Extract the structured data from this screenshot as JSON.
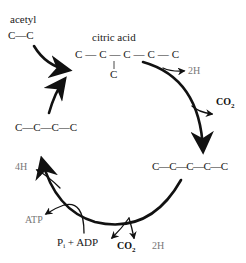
{
  "diagram": {
    "colors": {
      "main": "#111111",
      "secondary_label": "#777777"
    },
    "inputs": {
      "acetyl_label": "acetyl",
      "acetyl_formula": "C—C"
    },
    "compounds": {
      "citric_acid_label": "citric acid",
      "citric_acid_chain": "C—C—C—C—C",
      "citric_acid_branch": "C",
      "five_carbon": "C—C—C—C—C",
      "four_carbon": "C—C—C—C"
    },
    "outputs": {
      "h2_top": "2H",
      "co2_right_main": "CO",
      "co2_right_sub": "2",
      "four_h": "4H",
      "atp": "ATP",
      "pi_main": "P",
      "pi_sub": "i",
      "plus_adp": " + ADP",
      "co2_bottom_main": "CO",
      "co2_bottom_sub": "2",
      "h2_bottom": "2H"
    }
  }
}
